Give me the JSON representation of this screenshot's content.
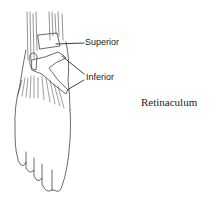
{
  "figure": {
    "labels": [
      {
        "text": "Superior",
        "x": 85,
        "y": 38
      },
      {
        "text": "Inferior",
        "x": 86,
        "y": 73
      }
    ],
    "caption": "Retinaculum",
    "colors": {
      "line": "#2a2a2a",
      "background": "#ffffff"
    }
  }
}
